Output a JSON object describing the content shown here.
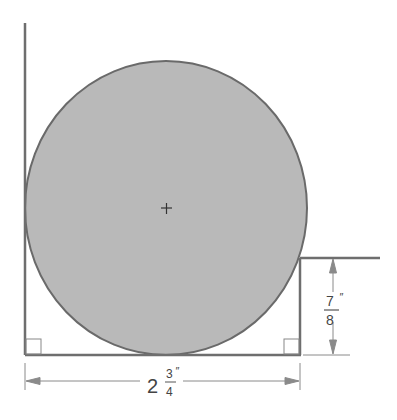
{
  "diagram": {
    "colors": {
      "circle_fill": "#b9b9b9",
      "stroke": "#6a6a6a",
      "dim_line": "#8a8a8a",
      "background": "#ffffff"
    },
    "center_mark": "+",
    "dimensions": {
      "width": {
        "whole": "2",
        "numerator": "3",
        "denominator": "4",
        "unit": "″",
        "value_in": 2.75
      },
      "step_height": {
        "numerator": "7",
        "denominator": "8",
        "unit": "″",
        "value_in": 0.875
      }
    },
    "right_angle_marks": [
      "bottom-left",
      "bottom-right"
    ]
  }
}
